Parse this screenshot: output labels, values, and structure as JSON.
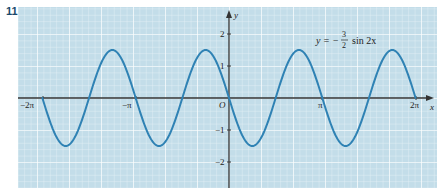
{
  "problem_number": "11",
  "colors": {
    "grid_bg": "#c3dde9",
    "grid_minor": "#e8f3f8",
    "grid_major": "#ffffff",
    "curve": "#2f82b4",
    "axis": "#333333"
  },
  "chart_data": {
    "type": "line",
    "title": "",
    "annotation": "y = -3/2 sin 2x",
    "xlabel": "x",
    "ylabel": "y",
    "xlim": [
      -6.6,
      6.65
    ],
    "ylim": [
      -2.8,
      2.8
    ],
    "x_ticks": [
      "-2π",
      "-π",
      "π",
      "2π"
    ],
    "y_ticks": [
      "2",
      "1",
      "-1",
      "-2"
    ],
    "origin_label": "O",
    "grid": true,
    "series": [
      {
        "name": "y = -3/2 sin 2x",
        "function": "-1.5*sin(2x)",
        "domain": [
          -6.2832,
          6.2832
        ],
        "x": [
          -6.2832,
          -5.4978,
          -4.7124,
          -3.927,
          -3.1416,
          -2.3562,
          -1.5708,
          -0.7854,
          0,
          0.7854,
          1.5708,
          2.3562,
          3.1416,
          3.927,
          4.7124,
          5.4978,
          6.2832
        ],
        "values": [
          0,
          -1.5,
          0,
          1.5,
          0,
          -1.5,
          0,
          1.5,
          0,
          -1.5,
          0,
          1.5,
          0,
          -1.5,
          0,
          1.5,
          0
        ]
      }
    ]
  },
  "labels": {
    "eq_lhs": "y = −",
    "eq_num": "3",
    "eq_den": "2",
    "eq_rhs": "sin 2x",
    "x_axis": "x",
    "y_axis": "y",
    "origin": "O",
    "xt_m2pi": "−2π",
    "xt_mpi": "−π",
    "xt_pi": "π",
    "xt_2pi": "2π",
    "yt_2": "2",
    "yt_1": "1",
    "yt_m1": "−1",
    "yt_m2": "−2"
  }
}
